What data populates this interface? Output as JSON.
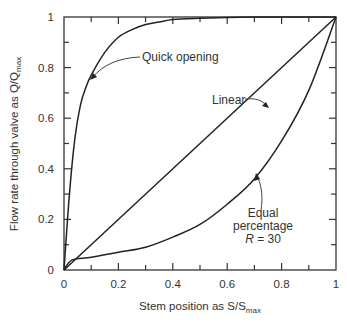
{
  "chart_data": {
    "type": "line",
    "title": "",
    "xlabel": "Stem position as S/S",
    "xlabel_sub": "max",
    "ylabel": "Flow rate through valve as Q/Q",
    "ylabel_sub": "max",
    "xlim": [
      0,
      1
    ],
    "ylim": [
      0,
      1
    ],
    "grid": false,
    "legend": "none (inline annotations)",
    "x_ticks": [
      "0",
      "0.2",
      "0.4",
      "0.6",
      "0.8",
      "1"
    ],
    "y_ticks": [
      "0",
      "0.2",
      "0.4",
      "0.6",
      "0.8",
      "1"
    ],
    "series": [
      {
        "name": "Quick opening",
        "x": [
          0,
          0.02,
          0.04,
          0.06,
          0.08,
          0.1,
          0.15,
          0.2,
          0.25,
          0.3,
          0.35,
          0.4,
          0.5,
          0.6,
          0.7,
          0.8,
          0.9,
          1.0
        ],
        "y": [
          0,
          0.3,
          0.52,
          0.65,
          0.72,
          0.77,
          0.86,
          0.92,
          0.95,
          0.97,
          0.98,
          0.99,
          0.995,
          0.998,
          1.0,
          1.0,
          1.0,
          1.0
        ]
      },
      {
        "name": "Linear",
        "x": [
          0,
          1
        ],
        "y": [
          0,
          1
        ]
      },
      {
        "name": "Equal percentage R = 30",
        "x": [
          0,
          0.03,
          0.1,
          0.2,
          0.3,
          0.4,
          0.5,
          0.6,
          0.7,
          0.8,
          0.9,
          1.0
        ],
        "y": [
          0,
          0.04,
          0.05,
          0.07,
          0.09,
          0.13,
          0.18,
          0.26,
          0.36,
          0.51,
          0.71,
          1.0
        ]
      }
    ],
    "annotations": [
      {
        "text": "Quick opening",
        "arrow_to": [
          0.1,
          0.77
        ]
      },
      {
        "text": "Linear",
        "arrow_to": [
          0.63,
          0.63
        ]
      },
      {
        "text": "Equal percentage",
        "line2": "R = 30",
        "arrow_to": [
          0.71,
          0.41
        ]
      }
    ]
  },
  "labels": {
    "quick": "Quick opening",
    "linear": "Linear",
    "eq1": "Equal",
    "eq2": "percentage",
    "eq3_r": "R",
    "eq3_rest": " = 30"
  }
}
